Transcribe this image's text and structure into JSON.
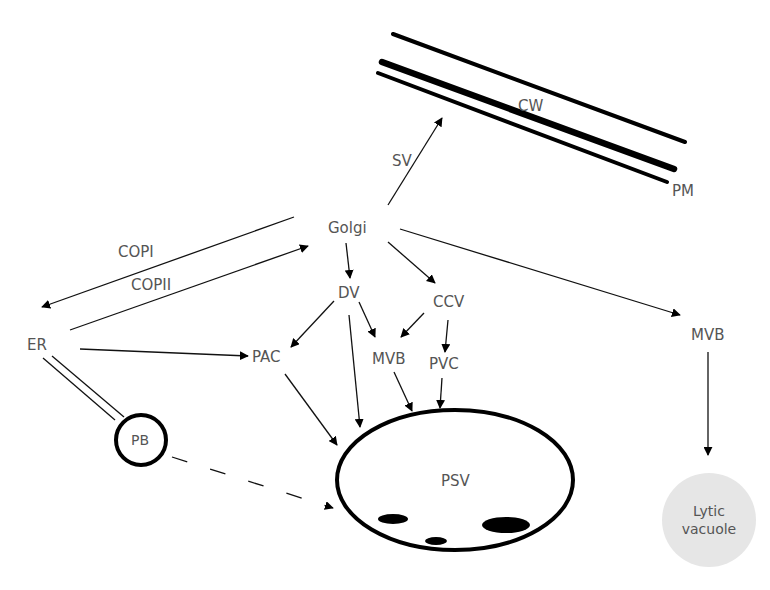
{
  "diagram": {
    "type": "plant secretory / vacuolar trafficking pathway",
    "nodes": {
      "golgi": {
        "label": "Golgi",
        "x": 348,
        "y": 232
      },
      "er": {
        "label": "ER",
        "x": 38,
        "y": 349
      },
      "dv": {
        "label": "DV",
        "x": 349,
        "y": 298
      },
      "ccv": {
        "label": "CCV",
        "x": 452,
        "y": 305
      },
      "pac": {
        "label": "PAC",
        "x": 264,
        "y": 361
      },
      "mvb_center": {
        "label": "MVB",
        "x": 392,
        "y": 360
      },
      "pvc": {
        "label": "PVC",
        "x": 443,
        "y": 370
      },
      "mvb_right": {
        "label": "MVB",
        "x": 706,
        "y": 338
      },
      "pb": {
        "label": "PB",
        "x": 140,
        "y": 441
      },
      "psv": {
        "label": "PSV",
        "x": 457,
        "y": 484
      },
      "lytic_vacuole": {
        "label_line1": "Lytic",
        "label_line2": "vacuole",
        "x": 707,
        "y": 518
      },
      "cw": {
        "label": "CW",
        "x": 530,
        "y": 106
      },
      "pm": {
        "label": "PM",
        "x": 686,
        "y": 191
      },
      "sv": {
        "label": "SV",
        "x": 402,
        "y": 161
      }
    },
    "edge_labels": {
      "copi": "COPI",
      "copii": "COPII"
    },
    "edges": [
      {
        "from": "Golgi",
        "to": "ER",
        "label": "COPI",
        "style": "solid"
      },
      {
        "from": "ER",
        "to": "Golgi",
        "label": "COPII",
        "style": "solid"
      },
      {
        "from": "Golgi",
        "to": "PM/CW",
        "label": "SV",
        "style": "solid"
      },
      {
        "from": "Golgi",
        "to": "DV",
        "style": "solid"
      },
      {
        "from": "Golgi",
        "to": "CCV",
        "style": "solid"
      },
      {
        "from": "Golgi",
        "to": "MVB (lytic route)",
        "style": "solid"
      },
      {
        "from": "ER",
        "to": "PAC",
        "style": "solid"
      },
      {
        "from": "DV",
        "to": "PAC",
        "style": "solid"
      },
      {
        "from": "DV",
        "to": "MVB",
        "style": "solid"
      },
      {
        "from": "DV",
        "to": "PSV",
        "style": "solid"
      },
      {
        "from": "CCV",
        "to": "MVB",
        "style": "solid"
      },
      {
        "from": "CCV",
        "to": "PVC",
        "style": "solid"
      },
      {
        "from": "PAC",
        "to": "PSV",
        "style": "solid"
      },
      {
        "from": "MVB",
        "to": "PSV",
        "style": "solid"
      },
      {
        "from": "PVC",
        "to": "PSV",
        "style": "solid"
      },
      {
        "from": "MVB",
        "to": "Lytic vacuole",
        "style": "solid"
      },
      {
        "from": "ER",
        "to": "PB",
        "style": "double-line"
      },
      {
        "from": "PB",
        "to": "PSV",
        "style": "dashed"
      }
    ],
    "colors": {
      "stroke": "#000000",
      "label": "#555555",
      "lytic_fill": "#e6e6e6",
      "background": "#ffffff"
    }
  }
}
